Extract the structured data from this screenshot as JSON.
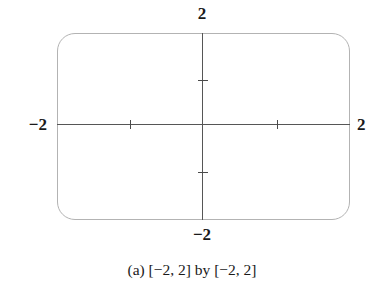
{
  "figure": {
    "caption": "(a) [−2, 2] by [−2, 2]",
    "background_color": "#ffffff",
    "box_border_color": "#b3b3b3",
    "axis_color": "#565656",
    "tick_color": "#4a4a4a",
    "label_color": "#1a1a1a"
  },
  "axis_labels": {
    "top": "2",
    "bottom": "−2",
    "left": "−2",
    "right": "2"
  },
  "chart_data": {
    "type": "scatter",
    "title": "",
    "subtitle": "",
    "xlabel": "",
    "ylabel": "",
    "xlim": [
      -2,
      2
    ],
    "ylim": [
      -2,
      2
    ],
    "xticks": [
      -1,
      1
    ],
    "yticks": [
      -1,
      1
    ],
    "xticklabels": [
      "",
      ""
    ],
    "yticklabels": [
      "",
      ""
    ],
    "x_axis_end_labels": [
      "−2",
      "2"
    ],
    "y_axis_end_labels": [
      "−2",
      "2"
    ],
    "grid": false,
    "legend": false,
    "series": [],
    "annotations": [
      "(a) [−2, 2] by [−2, 2]"
    ]
  }
}
